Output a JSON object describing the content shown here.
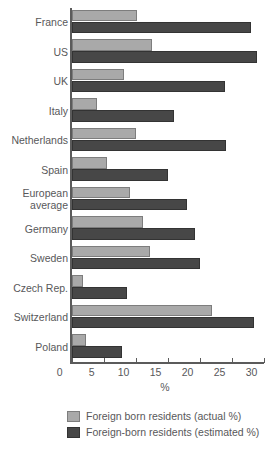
{
  "chart_data": {
    "type": "bar",
    "orientation": "horizontal",
    "title": "",
    "subtitle": "",
    "xlabel": "%",
    "ylabel": "",
    "xlim": [
      0,
      30
    ],
    "xticks": [
      0,
      5,
      10,
      15,
      20,
      25,
      30
    ],
    "xticklabels": [
      "0",
      "5",
      "10",
      "15",
      "20",
      "25",
      "30"
    ],
    "grid": false,
    "legend_position": "bottom",
    "categories": [
      "France",
      "US",
      "UK",
      "Italy",
      "Netherlands",
      "Spain",
      "European\naverage",
      "Germany",
      "Sweden",
      "Czech Rep.",
      "Switzerland",
      "Poland"
    ],
    "series": [
      {
        "name": "Foreign born residents (actual %)",
        "color": "#a9a9a9",
        "values": [
          10.2,
          12.5,
          8.2,
          4.0,
          10.1,
          5.5,
          9.1,
          11.1,
          12.2,
          1.8,
          22.0,
          2.3
        ]
      },
      {
        "name": "Foreign-born residents (estimated %)",
        "color": "#474747",
        "values": [
          28.0,
          29.0,
          24.0,
          16.0,
          24.2,
          15.0,
          18.0,
          19.3,
          20.0,
          8.7,
          28.5,
          7.8
        ]
      }
    ]
  },
  "legend": {
    "items": [
      {
        "label": "Foreign born residents (actual %)",
        "color": "#a9a9a9"
      },
      {
        "label": "Foreign-born residents (estimated %)",
        "color": "#474747"
      }
    ]
  }
}
